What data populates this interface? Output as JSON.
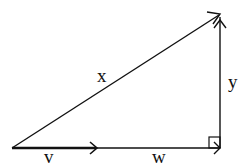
{
  "diagram": {
    "type": "vector right triangle",
    "stroke_color": "#111111",
    "background": "#ffffff",
    "labels": {
      "hypotenuse": "x",
      "vertical": "y",
      "base_short": "v",
      "base_rest": "w"
    },
    "vertices": {
      "origin": [
        12,
        148
      ],
      "right_angle": [
        220,
        148
      ],
      "apex": [
        220,
        14
      ]
    },
    "vectors": [
      {
        "name": "v",
        "from": [
          12,
          148
        ],
        "to": [
          97,
          148
        ],
        "bold": true
      },
      {
        "name": "w",
        "from": [
          12,
          148
        ],
        "to": [
          220,
          148
        ],
        "bold": false
      },
      {
        "name": "x",
        "from": [
          12,
          148
        ],
        "to": [
          220,
          14
        ],
        "bold": false
      },
      {
        "name": "y",
        "from": [
          220,
          148
        ],
        "to": [
          220,
          14
        ],
        "bold": false
      }
    ],
    "right_angle_marker": true
  }
}
